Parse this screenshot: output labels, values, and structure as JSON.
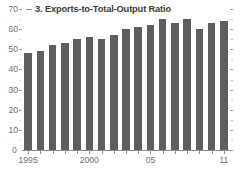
{
  "chart_data": {
    "type": "bar",
    "title": "3. Exports-to-Total-Output Ratio",
    "title_number": "3.",
    "xlabel": "",
    "ylabel": "",
    "ylim": [
      0,
      70
    ],
    "ytick_values": [
      0,
      10,
      20,
      30,
      40,
      50,
      60,
      70
    ],
    "ytick_labels": [
      "0",
      "10",
      "20",
      "30",
      "40",
      "50",
      "60",
      "70"
    ],
    "grid": false,
    "legend_position": "none",
    "x": [
      1995,
      1996,
      1997,
      1998,
      1999,
      2000,
      2001,
      2002,
      2003,
      2004,
      2005,
      2006,
      2007,
      2008,
      2009,
      2010,
      2011
    ],
    "categories": [
      "1995",
      "1996",
      "1997",
      "1998",
      "1999",
      "2000",
      "2001",
      "2002",
      "2003",
      "2004",
      "2005",
      "2006",
      "2007",
      "2008",
      "2009",
      "2010",
      "2011"
    ],
    "xtick_labels": [
      "1995",
      "",
      "",
      "",
      "",
      "2000",
      "",
      "",
      "",
      "",
      "05",
      "",
      "",
      "",
      "",
      "",
      "11"
    ],
    "xtick_labels_shown": [
      "1995",
      "2000",
      "05",
      "11"
    ],
    "values": [
      48,
      49,
      52,
      53,
      55,
      56,
      55,
      57,
      60,
      61,
      62,
      65,
      63,
      65,
      60,
      63,
      64
    ],
    "series": [
      {
        "name": "Exports-to-total-output ratio",
        "type": "bar",
        "color": "#5e5e5e",
        "values": [
          48,
          49,
          52,
          53,
          55,
          56,
          55,
          57,
          60,
          61,
          62,
          65,
          63,
          65,
          60,
          63,
          64
        ]
      },
      {
        "name": "Overlay line",
        "type": "line",
        "color": "#ffffff",
        "values": [
          28,
          27.5,
          27,
          27,
          26.8,
          26.5,
          26.5,
          26.5,
          26.8,
          27,
          27.2,
          27.5,
          27.8,
          28,
          27.5,
          28,
          28.2
        ]
      }
    ],
    "right_axis": {
      "ticks": true,
      "labels": []
    }
  }
}
